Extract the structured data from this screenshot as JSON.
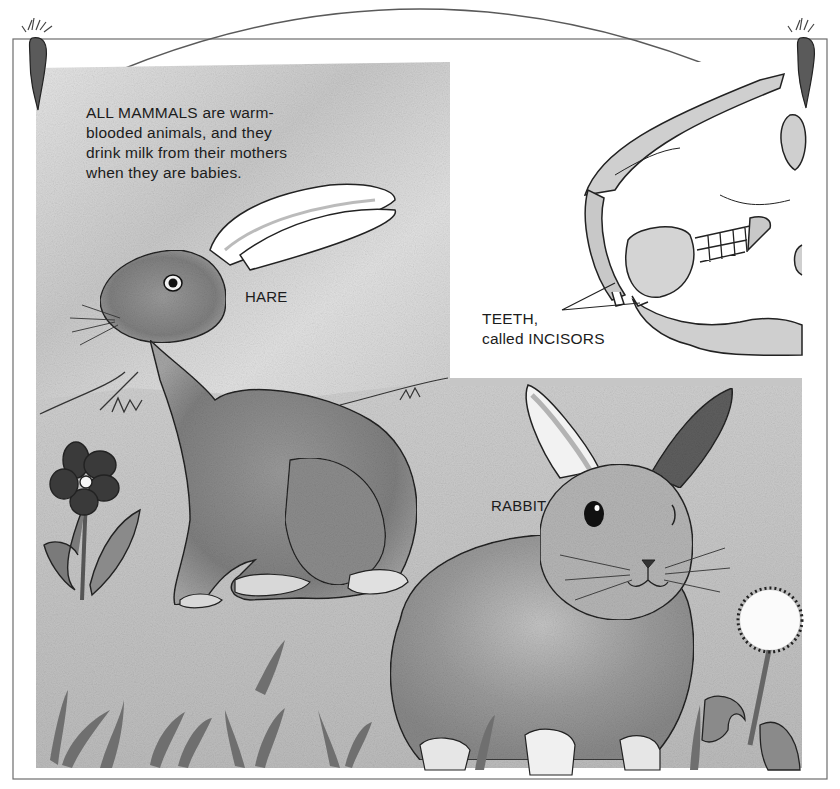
{
  "page": {
    "background": "#ffffff",
    "ink_color": "#1c1c1c",
    "wash_light": "#d8d8d8",
    "wash_mid": "#a8a8a8",
    "wash_dark": "#6a6a6a"
  },
  "intro_text": {
    "lines": [
      "ALL MAMMALS are warm-",
      "blooded animals, and they",
      "drink milk from their mothers",
      "when they are babies."
    ]
  },
  "labels": {
    "hare": "HARE",
    "rabbit": "RABBIT",
    "teeth": {
      "line1": "TEETH,",
      "line2": "called INCISORS"
    }
  },
  "decorations": {
    "corner_left": "carrot-icon",
    "corner_right": "carrot-icon"
  },
  "illustrations": [
    {
      "name": "hare",
      "kind": "watercolor-animal"
    },
    {
      "name": "rabbit",
      "kind": "watercolor-animal"
    },
    {
      "name": "skull-inset",
      "kind": "line-drawing"
    },
    {
      "name": "flower",
      "kind": "plant"
    },
    {
      "name": "dandelion",
      "kind": "plant"
    }
  ]
}
